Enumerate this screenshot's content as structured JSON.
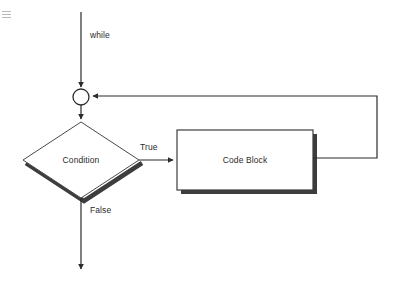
{
  "diagram": {
    "canvas": {
      "width": 398,
      "height": 288,
      "background": "#ffffff"
    },
    "colors": {
      "stroke": "#2b2b2b",
      "shadow": "#3d3d3d",
      "fill": "#ffffff",
      "text": "#2b2b2b"
    },
    "nodes": {
      "entry_label": "while",
      "merge_point": "",
      "condition": "Condition",
      "code_block": "Code Block"
    },
    "edges": {
      "true_label": "True",
      "false_label": "False"
    },
    "icons": {
      "corner_artifact": "hamburger-icon"
    }
  }
}
